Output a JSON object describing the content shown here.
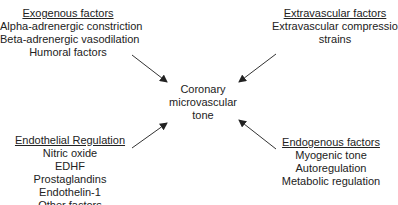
{
  "center": {
    "lines": [
      "Coronary",
      "microvascular",
      "tone"
    ]
  },
  "exogenous": {
    "title": "Exogenous factors",
    "items": [
      "Alpha-adrenergic constriction",
      "Beta-adrenergic vasodilation",
      "Humoral factors"
    ]
  },
  "extravascular": {
    "title": "Extravascular factors",
    "items": [
      "Extravascular compression",
      "strains"
    ]
  },
  "endothelial": {
    "title": "Endothelial Regulation",
    "items": [
      "Nitric oxide",
      "EDHF",
      "Prostaglandins",
      "Endothelin-1",
      "Other factors"
    ]
  },
  "endogenous": {
    "title": "Endogenous factors",
    "items": [
      "Myogenic tone",
      "Autoregulation",
      "Metabolic regulation"
    ]
  },
  "colors": {
    "text": "#222222",
    "arrow": "#333333",
    "background": "#ffffff"
  }
}
